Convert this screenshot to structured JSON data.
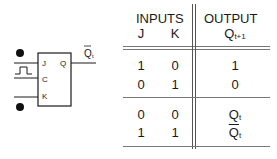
{
  "diagram": {
    "component": "JK flip-flop",
    "pins": {
      "j": "J",
      "c": "C",
      "k": "K",
      "q": "Q"
    },
    "output_label": {
      "main": "Q",
      "sub": "t",
      "overline": true
    }
  },
  "truth_table": {
    "headers": {
      "inputs": "INPUTS",
      "output": "OUTPUT"
    },
    "columns": {
      "j": "J",
      "k": "K",
      "q": "Q",
      "q_sub": "t+1"
    },
    "rows": [
      {
        "j": "1",
        "k": "0",
        "q": "1",
        "q_sub": ""
      },
      {
        "j": "0",
        "k": "1",
        "q": "0",
        "q_sub": ""
      },
      {
        "j": "0",
        "k": "0",
        "q": "Q",
        "q_sub": "t"
      },
      {
        "j": "1",
        "k": "1",
        "q": "Q",
        "q_sub": "t",
        "overline": true
      }
    ]
  }
}
